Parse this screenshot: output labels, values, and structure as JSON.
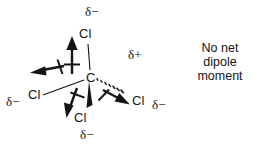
{
  "figure": {
    "central_atom": "C",
    "geometry": "tetrahedral",
    "ink_color": "#141414",
    "background_color": "#ffffff"
  },
  "caption": {
    "line1": "No net",
    "line2": "dipole",
    "line3": "moment"
  },
  "atoms": [
    {
      "id": "carbon",
      "label": "C",
      "x": 90,
      "y": 78,
      "charge": "δ+",
      "charge_x": 128,
      "charge_y": 51
    },
    {
      "id": "chlorine-top",
      "label": "Cl",
      "x": 84,
      "y": 34,
      "charge": "δ−",
      "charge_x": 90,
      "charge_y": 8
    },
    {
      "id": "chlorine-left",
      "label": "Cl",
      "x": 32,
      "y": 95,
      "charge": "δ−",
      "charge_x": 6,
      "charge_y": 99
    },
    {
      "id": "chlorine-bottom",
      "label": "Cl",
      "x": 78,
      "y": 117,
      "charge": "δ−",
      "charge_x": 84,
      "charge_y": 131
    },
    {
      "id": "chlorine-right",
      "label": "Cl",
      "x": 137,
      "y": 100,
      "charge": "δ−",
      "charge_x": 155,
      "charge_y": 101
    }
  ],
  "bonds": [
    {
      "id": "bond-c-cl-top",
      "type": "plain",
      "from": "carbon",
      "to": "chlorine-top"
    },
    {
      "id": "bond-c-cl-left",
      "type": "plain",
      "from": "carbon",
      "to": "chlorine-left"
    },
    {
      "id": "bond-c-cl-bottom",
      "type": "wedge",
      "from": "carbon",
      "to": "chlorine-bottom"
    },
    {
      "id": "bond-c-cl-right",
      "type": "hashed",
      "from": "carbon",
      "to": "chlorine-right"
    }
  ],
  "dipole_arrows": [
    {
      "id": "dipole-up",
      "direction": "up",
      "points_toward": "chlorine-top"
    },
    {
      "id": "dipole-left",
      "direction": "left",
      "points_toward": "chlorine-left"
    },
    {
      "id": "dipole-down-left",
      "direction": "down-left",
      "points_toward": "chlorine-bottom"
    },
    {
      "id": "dipole-down-right",
      "direction": "down-right",
      "points_toward": "chlorine-right"
    }
  ]
}
